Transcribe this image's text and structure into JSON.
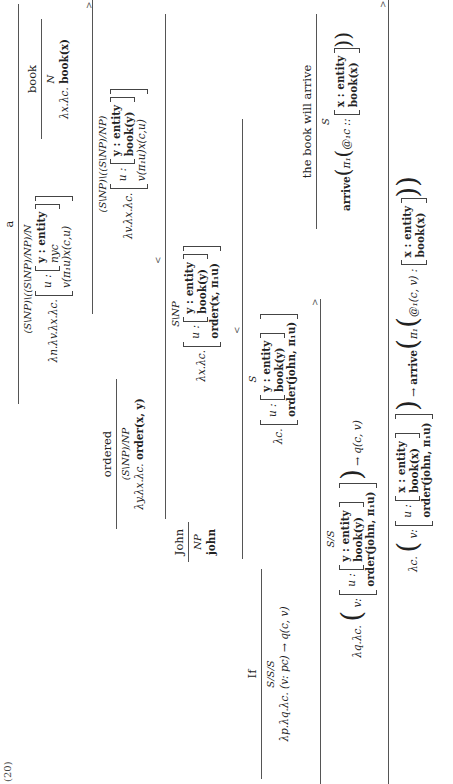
{
  "example_label": "(20)",
  "lexicon": {
    "a": {
      "word": "a",
      "category": "(S\\NP)\\((S\\NP)/NP)/N",
      "sem_prefix": "λn.λv.λx.λc.",
      "rec_label": "u :",
      "inner_rows": [
        "y : entity",
        "nyc"
      ],
      "outer_row": "v(π₁u)x(c,u)"
    },
    "book": {
      "word": "book",
      "category": "N",
      "sem_prefix": "λx.λc.",
      "sem_body": "book(x)"
    },
    "ordered": {
      "word": "ordered",
      "category": "(S\\NP)/NP",
      "sem_prefix": "λy.λx.λc.",
      "sem_body": "order(x, y)"
    },
    "john": {
      "word": "John",
      "category": "NP",
      "sem": "john"
    },
    "if": {
      "word": "If",
      "category": "S/S/S",
      "sem": "λp.λq.λc. (v: pc) → q(c, v)"
    },
    "the_book_will_arrive": {
      "word": "the book will arrive",
      "category": "S",
      "sem_prefix": "arrive",
      "sem_pi": "π₁",
      "sem_at": "@₁c ::",
      "inner_rows": [
        "x : entity",
        "book(x)"
      ]
    }
  },
  "steps": {
    "a_book": {
      "rule": ">",
      "category": "(S\\NP)\\((S\\NP)/NP)",
      "sem_prefix": "λv.λx.λc.",
      "rec_label": "u :",
      "inner_rows": [
        "y : entity",
        "book(y)"
      ],
      "outer_row": "v(π₁u)x(c,u)"
    },
    "ordered_a_book": {
      "rule": "<",
      "category": "S\\NP",
      "sem_prefix": "λx.λc.",
      "rec_label": "u :",
      "inner_rows": [
        "y : entity",
        "book(y)"
      ],
      "outer_row": "order(x, π₁u)"
    },
    "john_ordered_a_book": {
      "rule": "<",
      "category": "S",
      "sem_prefix": "λc.",
      "rec_label": "u :",
      "inner_rows": [
        "y : entity",
        "book(y)"
      ],
      "outer_row": "order(john, π₁u)"
    },
    "if_clause": {
      "rule": ">",
      "category": "S/S",
      "sem_prefix": "λq.λc.",
      "v_label": "v:",
      "rec_label": "u :",
      "inner_rows": [
        "y : entity",
        "book(y)"
      ],
      "outer_row": "order(john, π₁u)",
      "sem_suffix": "→ q(c, v)"
    },
    "final": {
      "rule": ">",
      "sem_prefix": "λc.",
      "v_label": "v:",
      "rec_label": "u :",
      "inner_rows": [
        "x : entity",
        "book(x)"
      ],
      "outer_row": "order(john, π₁u)",
      "arrow": "→",
      "arrive": "arrive",
      "pi": "π₁",
      "at": "@₁(c, v) :",
      "arrive_rows": [
        "x : entity",
        "book(x)"
      ]
    }
  }
}
